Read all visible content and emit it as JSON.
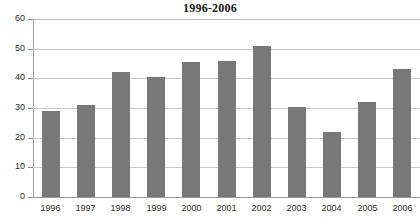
{
  "chart_data": {
    "type": "bar",
    "title": "1996-2006",
    "xlabel": "",
    "ylabel": "",
    "categories": [
      "1996",
      "1997",
      "1998",
      "1999",
      "2000",
      "2001",
      "2002",
      "2003",
      "2004",
      "2005",
      "2006"
    ],
    "values": [
      29,
      31,
      42,
      40.5,
      45.5,
      46,
      51,
      30.5,
      22,
      32,
      43
    ],
    "ylim": [
      0,
      60
    ],
    "yticks": [
      0,
      10,
      20,
      30,
      40,
      50,
      60
    ],
    "ytick_labels": [
      "0",
      "10",
      "20",
      "30",
      "40",
      "50",
      "60"
    ],
    "grid": true,
    "legend": false,
    "series": [
      {
        "name": "",
        "values": [
          29,
          31,
          42,
          40.5,
          45.5,
          46,
          51,
          30.5,
          22,
          32,
          43
        ],
        "color": "#787878"
      }
    ],
    "colors": {
      "bar": "#787878",
      "gridline": "#c9c9c9",
      "axis": "#9a9a9a",
      "text": "#2b2b2b",
      "title": "#141414",
      "background": "#ffffff"
    }
  }
}
